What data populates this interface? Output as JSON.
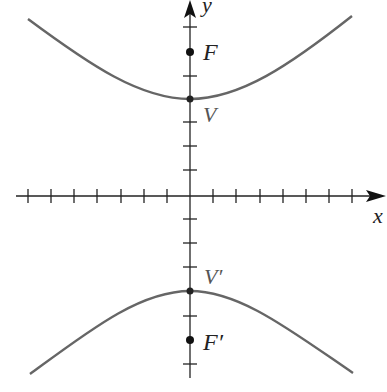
{
  "diagram": {
    "type": "hyperbola",
    "axes": {
      "x_label": "x",
      "y_label": "y",
      "x_ticks_each_side": 7,
      "y_ticks_each_side": 7
    },
    "points": {
      "focus_top": "F",
      "vertex_top": "V",
      "vertex_bottom": "V′",
      "focus_bottom": "F′"
    },
    "colors": {
      "curve": "#666666",
      "axes": "#222222"
    }
  }
}
